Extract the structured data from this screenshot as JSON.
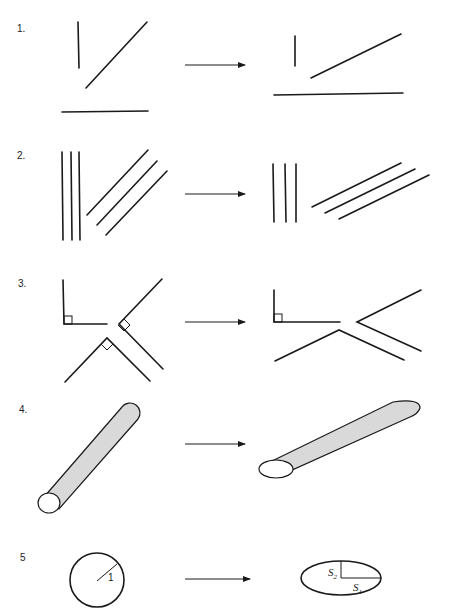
{
  "figure": {
    "rows": [
      {
        "label": "1.",
        "left": "vertical segment, diagonal segment, horizontal segment",
        "right": "transformed segments (diagonal less steep)"
      },
      {
        "label": "2.",
        "left": "three vertical parallel lines, three diagonal parallel lines",
        "right": "parallel lines remain parallel"
      },
      {
        "label": "3.",
        "left": "three right angles (marked)",
        "right": "only the axis-aligned right angle is preserved"
      },
      {
        "label": "4.",
        "left": "cylinder (tube) with circular cross-section",
        "right": "tube with elliptical cross-section"
      },
      {
        "label": "5",
        "left": "unit circle with radius 1",
        "right": "ellipse with semi-axes S1 and S2"
      }
    ],
    "annotations": {
      "radius_label": "1",
      "s1_base": "S",
      "s1_sub": "1",
      "s2_base": "S",
      "s2_sub": "2"
    }
  }
}
